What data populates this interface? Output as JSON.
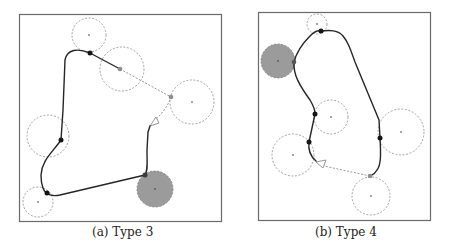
{
  "figure": {
    "panels": [
      {
        "id": "a",
        "caption": "(a) Type 3",
        "frame": {
          "x": 19,
          "y": 14,
          "w": 202,
          "h": 207
        },
        "circles": [
          {
            "cx": 89,
            "cy": 35,
            "r": 17,
            "filled": false
          },
          {
            "cx": 122,
            "cy": 69,
            "r": 22,
            "filled": false
          },
          {
            "cx": 192,
            "cy": 102,
            "r": 22,
            "filled": false
          },
          {
            "cx": 48,
            "cy": 136,
            "r": 21,
            "filled": false
          },
          {
            "cx": 38,
            "cy": 202,
            "r": 15,
            "filled": false
          },
          {
            "cx": 155,
            "cy": 189,
            "r": 18,
            "filled": true
          }
        ],
        "black_nodes": [
          [
            90,
            53
          ],
          [
            61,
            140
          ],
          [
            47,
            193
          ],
          [
            145,
            175
          ]
        ],
        "gray_nodes": [
          [
            120,
            69
          ],
          [
            171,
            97
          ]
        ]
      },
      {
        "id": "b",
        "caption": "(b) Type 4",
        "frame": {
          "x": 258,
          "y": 12,
          "w": 172,
          "h": 208
        },
        "circles": [
          {
            "cx": 317,
            "cy": 24,
            "r": 10,
            "filled": false
          },
          {
            "cx": 278,
            "cy": 61,
            "r": 17,
            "filled": true
          },
          {
            "cx": 331,
            "cy": 117,
            "r": 17,
            "filled": false
          },
          {
            "cx": 293,
            "cy": 155,
            "r": 21,
            "filled": false
          },
          {
            "cx": 401,
            "cy": 132,
            "r": 23,
            "filled": false
          },
          {
            "cx": 371,
            "cy": 196,
            "r": 19,
            "filled": false
          }
        ],
        "black_nodes": [
          [
            321,
            31
          ],
          [
            315,
            114
          ],
          [
            309,
            142
          ],
          [
            380,
            138
          ]
        ],
        "gray_nodes": [
          [
            294,
            62
          ],
          [
            370,
            176
          ]
        ]
      }
    ],
    "colors": {
      "frame": "#6a6a6a",
      "path": "#262626",
      "dashed": "#8a8a8a",
      "filled_circle": "#9b9b9b"
    }
  }
}
